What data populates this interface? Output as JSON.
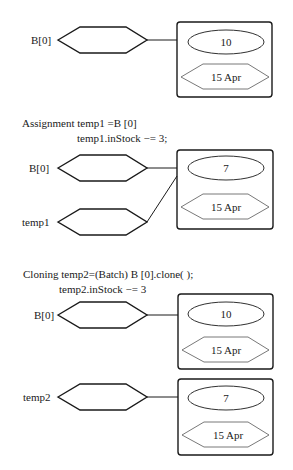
{
  "colors": {
    "stroke": "#1a1a1a",
    "inner_stroke": "#555555",
    "background": "#ffffff"
  },
  "section1": {
    "refs": [
      {
        "label": "B[0]"
      }
    ],
    "objects": [
      {
        "in_stock": "10",
        "date": "15 Apr"
      }
    ]
  },
  "section2": {
    "caption_line1": "Assignment temp1 =B [0]",
    "caption_line2": "temp1.inStock −= 3;",
    "refs": [
      {
        "label": "B[0]"
      },
      {
        "label": "temp1"
      }
    ],
    "objects": [
      {
        "in_stock": "7",
        "date": "15 Apr"
      }
    ]
  },
  "section3": {
    "caption_line1": "Cloning temp2=(Batch) B [0].clone( );",
    "caption_line2": "temp2.inStock −= 3",
    "refs": [
      {
        "label": "B[0]"
      },
      {
        "label": "temp2"
      }
    ],
    "objects": [
      {
        "in_stock": "10",
        "date": "15 Apr"
      },
      {
        "in_stock": "7",
        "date": "15 Apr"
      }
    ]
  }
}
